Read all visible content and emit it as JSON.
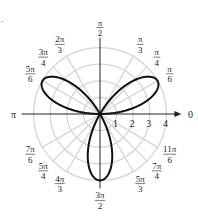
{
  "problem_marker": ".",
  "chart_data": {
    "type": "line",
    "subtype": "polar",
    "equation": "r = 4 sin(3θ)",
    "title": "",
    "radial_ticks": [
      "1",
      "2",
      "3",
      "4"
    ],
    "radial_range": [
      0,
      4
    ],
    "angle_labels": [
      {
        "angle_deg": 0,
        "num": "0",
        "den": ""
      },
      {
        "angle_deg": 30,
        "num": "π",
        "den": "6"
      },
      {
        "angle_deg": 45,
        "num": "π",
        "den": "4"
      },
      {
        "angle_deg": 60,
        "num": "π",
        "den": "3"
      },
      {
        "angle_deg": 90,
        "num": "π",
        "den": "2"
      },
      {
        "angle_deg": 120,
        "num": "2π",
        "den": "3"
      },
      {
        "angle_deg": 135,
        "num": "3π",
        "den": "4"
      },
      {
        "angle_deg": 150,
        "num": "5π",
        "den": "6"
      },
      {
        "angle_deg": 180,
        "num": "π",
        "den": ""
      },
      {
        "angle_deg": 210,
        "num": "7π",
        "den": "6"
      },
      {
        "angle_deg": 225,
        "num": "5π",
        "den": "4"
      },
      {
        "angle_deg": 240,
        "num": "4π",
        "den": "3"
      },
      {
        "angle_deg": 270,
        "num": "3π",
        "den": "2"
      },
      {
        "angle_deg": 300,
        "num": "5π",
        "den": "3"
      },
      {
        "angle_deg": 315,
        "num": "7π",
        "den": "4"
      },
      {
        "angle_deg": 330,
        "num": "11π",
        "den": "6"
      }
    ],
    "petals": [
      {
        "direction": "π/6",
        "max_r": 4
      },
      {
        "direction": "5π/6",
        "max_r": 4
      },
      {
        "direction": "3π/2",
        "max_r": 4
      }
    ],
    "grid": true,
    "colors": {
      "curve": "#111111",
      "grid": "#d4d4d4",
      "axis": "#222222"
    }
  }
}
